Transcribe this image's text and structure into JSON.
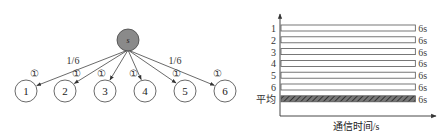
{
  "tree": {
    "root": {
      "label": "s",
      "fill": "#8a8a8a"
    },
    "leaves": [
      {
        "label": "1",
        "edge_marker": "①"
      },
      {
        "label": "2",
        "edge_marker": "①"
      },
      {
        "label": "3",
        "edge_marker": "①"
      },
      {
        "label": "4",
        "edge_marker": "①"
      },
      {
        "label": "5",
        "edge_marker": "①"
      },
      {
        "label": "6",
        "edge_marker": "①"
      }
    ],
    "edge_weight_labels": [
      "1/6",
      "1/6"
    ]
  },
  "chart_data": {
    "type": "bar",
    "orientation": "horizontal",
    "categories": [
      "1",
      "2",
      "3",
      "4",
      "5",
      "6",
      "平均"
    ],
    "values": [
      6,
      6,
      6,
      6,
      6,
      6,
      6
    ],
    "value_labels": [
      "6s",
      "6s",
      "6s",
      "6s",
      "6s",
      "6s",
      "6s"
    ],
    "xlabel": "通信时间/s",
    "ylabel": "",
    "xlim": [
      0,
      6.7
    ],
    "grid": false,
    "bar_styles": [
      "outline",
      "outline",
      "outline",
      "outline",
      "outline",
      "outline",
      "hatched"
    ],
    "colors": {
      "outline": "#555555",
      "hatch": "#444444"
    }
  }
}
